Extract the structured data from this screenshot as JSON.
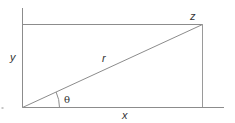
{
  "diagram": {
    "title": "",
    "type": "polar-coordinates",
    "labels": {
      "y": "y",
      "r": "r",
      "z": "z",
      "theta": "θ",
      "x": "x"
    },
    "colors": {
      "lines": "#8c8c8c",
      "text": "#333333",
      "background": "#ffffff"
    },
    "geometry": {
      "origin": [
        22.5,
        107.5
      ],
      "point_z": [
        202.5,
        24.5
      ],
      "x_axis_end": [
        224,
        107.5
      ],
      "y_axis_top": [
        22.5,
        8
      ],
      "theta_arc_radius": 37
    }
  }
}
